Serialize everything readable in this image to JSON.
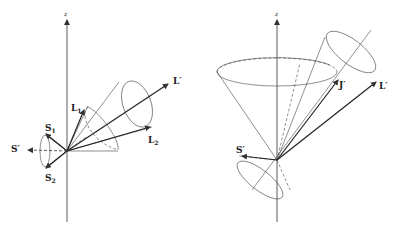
{
  "figure": {
    "left_panel": {
      "axis_label": "z",
      "labels": {
        "L1": "L",
        "L1_sub": "1",
        "L2": "L",
        "L2_sub": "2",
        "Lprime": "L′",
        "S1": "S",
        "S1_sub": "1",
        "S2": "S",
        "S2_sub": "2",
        "Sprime": "S′"
      }
    },
    "right_panel": {
      "axis_label": "z",
      "labels": {
        "Jprime": "J′",
        "Lprime": "L′",
        "Sprime": "S′"
      }
    },
    "colors": {
      "line": "#333333",
      "background": "#ffffff"
    }
  }
}
